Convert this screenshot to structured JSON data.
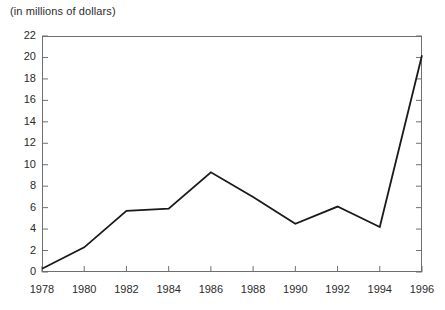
{
  "chart_data": {
    "type": "line",
    "title": "(in millions of dollars)",
    "xlabel": "",
    "ylabel": "",
    "x": [
      1978,
      1980,
      1982,
      1984,
      1986,
      1988,
      1990,
      1992,
      1994,
      1996
    ],
    "categories": [
      "1978",
      "1980",
      "1982",
      "1984",
      "1986",
      "1988",
      "1990",
      "1992",
      "1994",
      "1996"
    ],
    "values": [
      0.3,
      2.3,
      5.7,
      5.9,
      9.3,
      7.0,
      4.5,
      6.1,
      4.2,
      20.2
    ],
    "series": [
      {
        "name": "",
        "values": [
          0.3,
          2.3,
          5.7,
          5.9,
          9.3,
          7.0,
          4.5,
          6.1,
          4.2,
          20.2
        ]
      }
    ],
    "xlim": [
      1978,
      1996
    ],
    "ylim": [
      0,
      22
    ],
    "ytick_labels": [
      "0",
      "2",
      "4",
      "6",
      "8",
      "10",
      "12",
      "14",
      "16",
      "18",
      "20",
      "22"
    ],
    "ytick_values": [
      0,
      2,
      4,
      6,
      8,
      10,
      12,
      14,
      16,
      18,
      20,
      22
    ],
    "xtick_labels": [
      "1978",
      "1980",
      "1982",
      "1984",
      "1986",
      "1988",
      "1990",
      "1992",
      "1994",
      "1996"
    ],
    "xtick_values": [
      1978,
      1980,
      1982,
      1984,
      1986,
      1988,
      1990,
      1992,
      1994,
      1996
    ],
    "grid": false,
    "legend": null,
    "legend_position": "none",
    "line_color": "#1a1a1a",
    "axis_color": "#6f6f6f",
    "background_color": "#ffffff",
    "markers": false
  }
}
